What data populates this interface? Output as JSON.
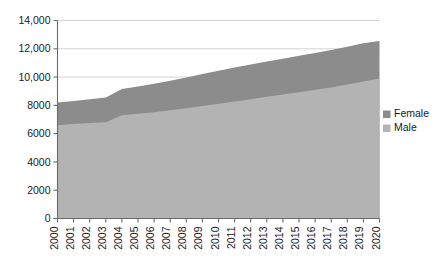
{
  "chart_data": {
    "type": "area",
    "stacked": true,
    "title": "",
    "xlabel": "",
    "ylabel": "",
    "categories": [
      "2000",
      "2001",
      "2002",
      "2003",
      "2004",
      "2005",
      "2006",
      "2007",
      "2008",
      "2009",
      "2010",
      "2011",
      "2012",
      "2013",
      "2014",
      "2015",
      "2016",
      "2017",
      "2018",
      "2019",
      "2020"
    ],
    "series": [
      {
        "name": "Male",
        "color": "#b3b3b3",
        "values": [
          6600,
          6680,
          6750,
          6810,
          7300,
          7400,
          7520,
          7650,
          7800,
          7960,
          8120,
          8280,
          8440,
          8600,
          8760,
          8930,
          9100,
          9270,
          9470,
          9680,
          9900
        ]
      },
      {
        "name": "Female",
        "color": "#8c8c8c",
        "values": [
          1600,
          1620,
          1680,
          1740,
          1850,
          1930,
          2010,
          2090,
          2170,
          2250,
          2320,
          2390,
          2450,
          2500,
          2540,
          2570,
          2600,
          2640,
          2680,
          2710,
          2650
        ]
      }
    ],
    "totals": [
      8200,
      8300,
      8430,
      8550,
      9150,
      9330,
      9530,
      9740,
      9970,
      10210,
      10440,
      10670,
      10890,
      11100,
      11300,
      11500,
      11700,
      11910,
      12150,
      12390,
      12550
    ],
    "ylim": [
      0,
      14000
    ],
    "yticks": [
      0,
      2000,
      4000,
      6000,
      8000,
      10000,
      12000,
      14000
    ],
    "ytick_labels": [
      "0",
      "2000",
      "4000",
      "6000",
      "8000",
      "10,000",
      "12,000",
      "14,000"
    ],
    "grid": true,
    "grid_axis": "y",
    "legend_position": "right",
    "legend": [
      {
        "label": "Female",
        "color": "#8c8c8c"
      },
      {
        "label": "Male",
        "color": "#b3b3b3"
      }
    ]
  },
  "axes": {
    "x_tick_rotation": "-90"
  }
}
